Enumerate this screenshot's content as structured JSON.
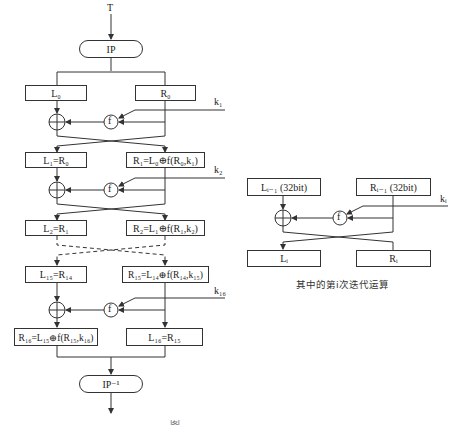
{
  "input_label": "T",
  "ip_label": "IP",
  "ip_inverse_label": "IP⁻¹",
  "main_diagram": {
    "rounds": [
      {
        "left": "L₀",
        "right": "R₀",
        "key": "k₁"
      },
      {
        "left": "L₁=R₀",
        "right": "R₁=L₀⊕f(R₀,k₁)",
        "key": "k₂"
      },
      {
        "left": "L₂=R₁",
        "right": "R₂=L₁⊕f(R₁,k₂)"
      },
      {
        "left": "L₁₅=R₁₄",
        "right": "R₁₅=L₁₄⊕f(R₁₄,k₁₅)",
        "key": "k₁₆"
      },
      {
        "left": "R₁₆=L₁₅⊕f(R₁₅,k₁₆)",
        "right": "L₁₆=R₁₅"
      }
    ],
    "f_label": "f"
  },
  "iteration_diagram": {
    "left_in": "Lᵢ₋₁ (32bit)",
    "right_in": "Rᵢ₋₁ (32bit)",
    "key": "kᵢ",
    "left_out": "Lᵢ",
    "right_out": "Rᵢ",
    "f_label": "f",
    "caption": "其中的第i次迭代运算"
  },
  "figure_caption": "图"
}
